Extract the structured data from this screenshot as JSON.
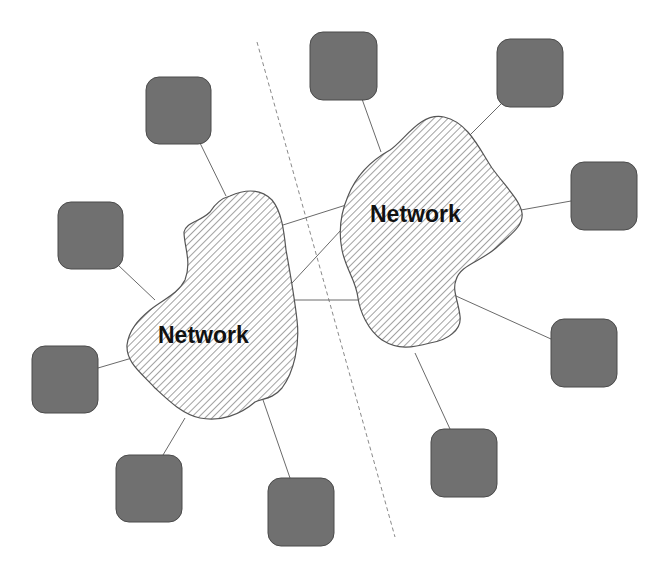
{
  "diagram": {
    "title_fragment": "",
    "colors": {
      "node_fill": "#707070",
      "node_stroke": "#4a4a4a",
      "cloud_stroke": "#555555",
      "hatch": "#8a8a8a",
      "link": "#6a6a6a",
      "divider": "#8a8a8a",
      "label": "#111111"
    },
    "clouds": [
      {
        "id": "left-network",
        "label": "Network"
      },
      {
        "id": "right-network",
        "label": "Network"
      }
    ],
    "nodes": [
      {
        "id": "node-left-1",
        "network": "left-network"
      },
      {
        "id": "node-left-2",
        "network": "left-network"
      },
      {
        "id": "node-left-3",
        "network": "left-network"
      },
      {
        "id": "node-left-4",
        "network": "left-network"
      },
      {
        "id": "node-left-5",
        "network": "left-network"
      },
      {
        "id": "node-right-1",
        "network": "right-network"
      },
      {
        "id": "node-right-2",
        "network": "right-network"
      },
      {
        "id": "node-right-3",
        "network": "right-network"
      },
      {
        "id": "node-right-4",
        "network": "right-network"
      },
      {
        "id": "node-right-5",
        "network": "right-network"
      }
    ],
    "inter_network_links": 3,
    "divider": "dashed"
  }
}
